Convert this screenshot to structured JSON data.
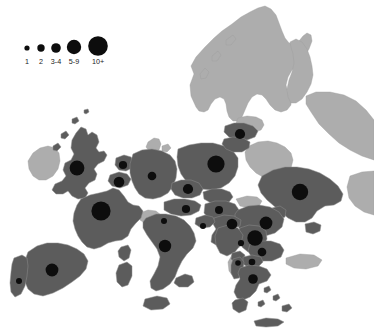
{
  "figure": {
    "type": "proportional-symbol-map",
    "region": "Europe",
    "background_color": "#ffffff",
    "land_with_data_color": "#5c5c5c",
    "land_no_data_color": "#adadad",
    "border_color": "#8f8f8f",
    "symbol_color": "#0d0d0d"
  },
  "legend": {
    "name": "symbol-size-legend",
    "items": [
      {
        "label": "1",
        "radius": 2.6,
        "cx": 27,
        "cy": 48
      },
      {
        "label": "2",
        "radius": 3.7,
        "cx": 41,
        "cy": 48
      },
      {
        "label": "3-4",
        "radius": 4.8,
        "cx": 56,
        "cy": 48
      },
      {
        "label": "5-9",
        "radius": 7.2,
        "cx": 74,
        "cy": 47
      },
      {
        "label": "10+",
        "radius": 9.8,
        "cx": 98,
        "cy": 46
      }
    ],
    "label_y": 64
  },
  "chart_data": {
    "type": "scatter",
    "title": "",
    "xlabel": "",
    "ylabel": "",
    "legend_position": "top-left",
    "size_classes": [
      "1",
      "2",
      "3-4",
      "5-9",
      "10+"
    ],
    "points": [
      {
        "name": "London",
        "x": 77,
        "y": 168,
        "r": 7.4,
        "class": "5-9"
      },
      {
        "name": "Paris",
        "x": 101,
        "y": 211,
        "r": 9.6,
        "class": "10+"
      },
      {
        "name": "Amsterdam",
        "x": 123,
        "y": 165,
        "r": 4.1,
        "class": "3-4"
      },
      {
        "name": "Brussels",
        "x": 119,
        "y": 182,
        "r": 5.3,
        "class": "3-4"
      },
      {
        "name": "Madrid",
        "x": 52,
        "y": 270,
        "r": 6.4,
        "class": "5-9"
      },
      {
        "name": "Lisbon",
        "x": 19,
        "y": 281,
        "r": 3.0,
        "class": "2"
      },
      {
        "name": "Berlin",
        "x": 152,
        "y": 176,
        "r": 4.3,
        "class": "3-4"
      },
      {
        "name": "Warsaw",
        "x": 216,
        "y": 164,
        "r": 8.6,
        "class": "10+"
      },
      {
        "name": "Prague",
        "x": 188,
        "y": 189,
        "r": 5.1,
        "class": "3-4"
      },
      {
        "name": "Vienna",
        "x": 186,
        "y": 209,
        "r": 4.1,
        "class": "3-4"
      },
      {
        "name": "Bratislava",
        "x": 164,
        "y": 221,
        "r": 3.0,
        "class": "2"
      },
      {
        "name": "Budapest",
        "x": 219,
        "y": 210,
        "r": 4.0,
        "class": "3-4"
      },
      {
        "name": "Riga",
        "x": 240,
        "y": 134,
        "r": 5.1,
        "class": "3-4"
      },
      {
        "name": "Kyiv",
        "x": 300,
        "y": 192,
        "r": 8.2,
        "class": "10+"
      },
      {
        "name": "Bucharest",
        "x": 266,
        "y": 223,
        "r": 6.4,
        "class": "5-9"
      },
      {
        "name": "Belgrade",
        "x": 255,
        "y": 238,
        "r": 7.7,
        "class": "5-9"
      },
      {
        "name": "Zagreb",
        "x": 232,
        "y": 224,
        "r": 5.3,
        "class": "3-4"
      },
      {
        "name": "Sofia",
        "x": 262,
        "y": 252,
        "r": 4.3,
        "class": "3-4"
      },
      {
        "name": "Skopje",
        "x": 252,
        "y": 262,
        "r": 3.3,
        "class": "2"
      },
      {
        "name": "Tirana",
        "x": 238,
        "y": 263,
        "r": 2.8,
        "class": "1"
      },
      {
        "name": "Athens",
        "x": 253,
        "y": 279,
        "r": 4.8,
        "class": "3-4"
      },
      {
        "name": "Rome",
        "x": 165,
        "y": 246,
        "r": 6.2,
        "class": "5-9"
      },
      {
        "name": "Ljubljana",
        "x": 203,
        "y": 226,
        "r": 3.0,
        "class": "2"
      },
      {
        "name": "Sarajevo",
        "x": 241,
        "y": 243,
        "r": 3.1,
        "class": "2"
      }
    ]
  },
  "regions_with_data": [
    "United Kingdom",
    "France",
    "Spain",
    "Portugal",
    "Netherlands",
    "Belgium",
    "Germany",
    "Poland",
    "Czechia",
    "Slovakia",
    "Austria",
    "Hungary",
    "Latvia",
    "Lithuania",
    "Ukraine",
    "Romania",
    "Serbia",
    "Croatia",
    "Slovenia",
    "Bulgaria",
    "North Macedonia",
    "Albania",
    "Greece",
    "Italy",
    "Bosnia and Herzegovina",
    "Moldova",
    "Montenegro"
  ],
  "regions_no_data": [
    "Ireland",
    "Norway",
    "Sweden",
    "Finland",
    "Estonia",
    "Belarus",
    "Denmark",
    "Switzerland",
    "Russia"
  ]
}
